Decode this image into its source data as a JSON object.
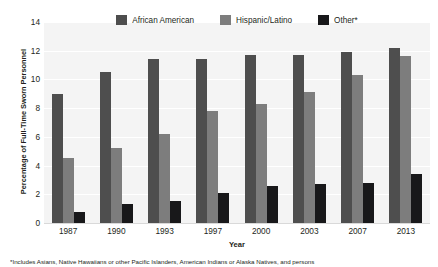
{
  "chart_data": {
    "type": "bar",
    "title": "",
    "subtitle": "",
    "xlabel": "Year",
    "ylabel": "Percentage of Full-Time Sworn Personnel",
    "categories": [
      "1987",
      "1990",
      "1993",
      "1997",
      "2000",
      "2003",
      "2007",
      "2013"
    ],
    "series": [
      {
        "name": "African American",
        "color": "#4e4e4e",
        "values": [
          9.0,
          10.5,
          11.4,
          11.4,
          11.7,
          11.7,
          11.9,
          12.2
        ]
      },
      {
        "name": "Hispanic/Latino",
        "color": "#7d7d7d",
        "values": [
          4.5,
          5.2,
          6.2,
          7.8,
          8.3,
          9.1,
          10.3,
          11.6
        ]
      },
      {
        "name": "Other*",
        "color": "#18181a",
        "values": [
          0.8,
          1.3,
          1.5,
          2.1,
          2.6,
          2.7,
          2.8,
          3.4
        ]
      }
    ],
    "ylim": [
      0,
      14
    ],
    "yticks": [
      "0",
      "2",
      "4",
      "6",
      "8",
      "10",
      "12",
      "14"
    ],
    "ytick_values": [
      0,
      2,
      4,
      6,
      8,
      10,
      12,
      14
    ],
    "grid": true,
    "legend_position": "top-center",
    "plot_background": "#f4f4f4",
    "annotations": []
  },
  "footnote": {
    "text": "*Includes Asians, Native Hawaiians or other Pacific Islanders, American Indians or Alaska Natives, and persons"
  }
}
